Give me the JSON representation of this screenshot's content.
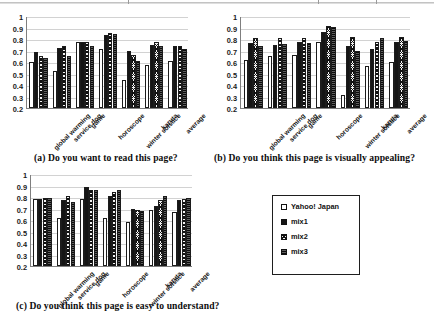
{
  "figure": {
    "y_axis": {
      "ticks": [
        "1",
        "0.9",
        "0.8",
        "0.7",
        "0.6",
        "0.5",
        "0.4",
        "0.3",
        "0.2"
      ],
      "min": 0.2,
      "max": 1.0
    },
    "categories": [
      "global warming",
      "service dog",
      "game",
      "horoscope",
      "winter solstice",
      "karuta",
      "average"
    ],
    "legend": {
      "items": [
        {
          "label": "Yahoo! Japan",
          "swatch": "white-square-icon",
          "color": "#ffffff"
        },
        {
          "label": "mix1",
          "swatch": "black-square-icon",
          "color": "#151515"
        },
        {
          "label": "mix2",
          "swatch": "hatched-square-icon",
          "color": "#f2f2f2"
        },
        {
          "label": "mix3",
          "swatch": "dotted-square-icon",
          "color": "#3c3c3c"
        }
      ]
    }
  },
  "chart_data": [
    {
      "type": "bar",
      "id": "chart-a",
      "title": "(a) Do you want to read this page?",
      "xlabel": "",
      "ylabel": "",
      "ylim": [
        0.2,
        1.0
      ],
      "grid": true,
      "legend_position": "external",
      "categories": [
        "global warming",
        "service dog",
        "game",
        "horoscope",
        "winter solstice",
        "karuta",
        "average"
      ],
      "series": [
        {
          "name": "Yahoo! Japan",
          "values": [
            0.6,
            0.525,
            0.775,
            0.71,
            0.445,
            0.57,
            0.61
          ]
        },
        {
          "name": "mix1",
          "values": [
            0.69,
            0.72,
            0.775,
            0.835,
            0.7,
            0.745,
            0.74
          ]
        },
        {
          "name": "mix2",
          "values": [
            0.65,
            0.74,
            0.775,
            0.855,
            0.665,
            0.77,
            0.74
          ]
        },
        {
          "name": "mix3",
          "values": [
            0.635,
            0.655,
            0.735,
            0.845,
            0.605,
            0.74,
            0.715
          ]
        }
      ]
    },
    {
      "type": "bar",
      "id": "chart-b",
      "title": "(b) Do you think this page is visually appealing?",
      "xlabel": "",
      "ylabel": "",
      "ylim": [
        0.2,
        1.0
      ],
      "grid": true,
      "legend_position": "external",
      "categories": [
        "global warming",
        "service dog",
        "game",
        "horoscope",
        "winter solstice",
        "karuta",
        "average"
      ],
      "series": [
        {
          "name": "Yahoo! Japan",
          "values": [
            0.62,
            0.655,
            0.665,
            0.77,
            0.31,
            0.565,
            0.6
          ]
        },
        {
          "name": "mix1",
          "values": [
            0.765,
            0.75,
            0.775,
            0.865,
            0.74,
            0.71,
            0.775
          ]
        },
        {
          "name": "mix2",
          "values": [
            0.805,
            0.81,
            0.81,
            0.91,
            0.815,
            0.775,
            0.815
          ]
        },
        {
          "name": "mix3",
          "values": [
            0.735,
            0.755,
            0.765,
            0.905,
            0.7,
            0.805,
            0.78
          ]
        }
      ]
    },
    {
      "type": "bar",
      "id": "chart-c",
      "title": "(c) Do you think this page is easy to understand?",
      "xlabel": "",
      "ylabel": "",
      "ylim": [
        0.2,
        1.0
      ],
      "grid": true,
      "legend_position": "external",
      "categories": [
        "global warming",
        "service dog",
        "game",
        "horoscope",
        "winter solstice",
        "karuta",
        "average"
      ],
      "series": [
        {
          "name": "Yahoo! Japan",
          "values": [
            0.785,
            0.615,
            0.78,
            0.615,
            0.585,
            0.685,
            0.67
          ]
        },
        {
          "name": "mix1",
          "values": [
            0.785,
            0.775,
            0.885,
            0.805,
            0.695,
            0.72,
            0.775
          ]
        },
        {
          "name": "mix2",
          "values": [
            0.79,
            0.81,
            0.865,
            0.845,
            0.69,
            0.775,
            0.785
          ]
        },
        {
          "name": "mix3",
          "values": [
            0.79,
            0.76,
            0.865,
            0.865,
            0.68,
            0.805,
            0.79
          ]
        }
      ]
    }
  ]
}
